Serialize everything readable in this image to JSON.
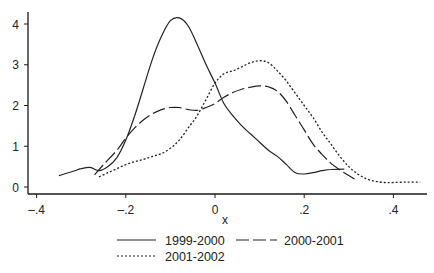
{
  "chart_data": {
    "type": "line",
    "title": "",
    "xlabel": "x",
    "ylabel": "",
    "xlim": [
      -0.42,
      0.47
    ],
    "ylim": [
      0,
      4.3
    ],
    "xticks": [
      -0.4,
      -0.2,
      0,
      0.2,
      0.4
    ],
    "xtick_labels": [
      "-.4",
      "-.2",
      "0",
      ".2",
      ".4"
    ],
    "yticks": [
      0,
      1,
      2,
      3,
      4
    ],
    "ytick_labels": [
      "0",
      "1",
      "2",
      "3",
      "4"
    ],
    "grid": false,
    "legend_position": "bottom",
    "series": [
      {
        "name": "1999-2000",
        "style": "solid",
        "x": [
          -0.35,
          -0.32,
          -0.3,
          -0.28,
          -0.26,
          -0.24,
          -0.22,
          -0.2,
          -0.18,
          -0.16,
          -0.14,
          -0.12,
          -0.1,
          -0.08,
          -0.06,
          -0.04,
          -0.02,
          0.0,
          0.02,
          0.04,
          0.06,
          0.08,
          0.1,
          0.12,
          0.14,
          0.16,
          0.18,
          0.2,
          0.22,
          0.24,
          0.26,
          0.29
        ],
        "y": [
          0.28,
          0.38,
          0.45,
          0.48,
          0.4,
          0.5,
          0.72,
          1.15,
          1.75,
          2.45,
          3.15,
          3.7,
          4.08,
          4.15,
          3.95,
          3.5,
          3.0,
          2.55,
          2.05,
          1.75,
          1.5,
          1.3,
          1.1,
          0.9,
          0.75,
          0.55,
          0.35,
          0.32,
          0.35,
          0.4,
          0.43,
          0.44
        ]
      },
      {
        "name": "2000-2001",
        "style": "dashed",
        "x": [
          -0.27,
          -0.25,
          -0.22,
          -0.2,
          -0.18,
          -0.16,
          -0.14,
          -0.12,
          -0.1,
          -0.08,
          -0.06,
          -0.04,
          -0.02,
          0.0,
          0.02,
          0.04,
          0.06,
          0.08,
          0.1,
          0.12,
          0.14,
          0.16,
          0.18,
          0.2,
          0.22,
          0.24,
          0.26,
          0.28,
          0.3,
          0.32
        ],
        "y": [
          0.3,
          0.55,
          0.9,
          1.2,
          1.45,
          1.65,
          1.8,
          1.9,
          1.95,
          1.95,
          1.9,
          1.88,
          1.95,
          2.05,
          2.2,
          2.32,
          2.4,
          2.45,
          2.48,
          2.46,
          2.35,
          2.1,
          1.75,
          1.4,
          1.05,
          0.8,
          0.58,
          0.42,
          0.28,
          0.15
        ]
      },
      {
        "name": "2001-2002",
        "style": "dotted",
        "x": [
          -0.26,
          -0.24,
          -0.22,
          -0.2,
          -0.18,
          -0.16,
          -0.14,
          -0.12,
          -0.1,
          -0.08,
          -0.06,
          -0.04,
          -0.02,
          0.0,
          0.02,
          0.04,
          0.06,
          0.08,
          0.1,
          0.12,
          0.14,
          0.16,
          0.18,
          0.2,
          0.22,
          0.24,
          0.26,
          0.28,
          0.3,
          0.32,
          0.34,
          0.36,
          0.38,
          0.4,
          0.43,
          0.46
        ],
        "y": [
          0.25,
          0.35,
          0.45,
          0.55,
          0.62,
          0.68,
          0.75,
          0.82,
          0.95,
          1.15,
          1.45,
          1.75,
          2.15,
          2.55,
          2.78,
          2.85,
          2.95,
          3.05,
          3.1,
          3.05,
          2.85,
          2.6,
          2.3,
          2.0,
          1.7,
          1.35,
          1.05,
          0.75,
          0.5,
          0.32,
          0.2,
          0.14,
          0.11,
          0.11,
          0.12,
          0.12
        ]
      }
    ],
    "legend": [
      {
        "label": "1999-2000",
        "style": "solid"
      },
      {
        "label": "2000-2001",
        "style": "dashed"
      },
      {
        "label": "2001-2002",
        "style": "dotted"
      }
    ]
  }
}
